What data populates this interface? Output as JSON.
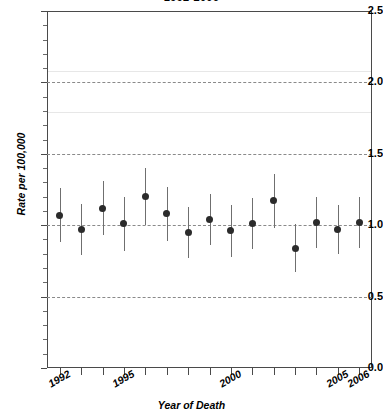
{
  "chart_data": {
    "type": "scatter",
    "title": "1992-2006",
    "xlabel": "Year of Death",
    "ylabel": "Rate per 100,000",
    "xlim": [
      1991.4,
      2006.6
    ],
    "ylim": [
      0.0,
      2.5
    ],
    "grid": true,
    "legend": "none",
    "y_ticks": [
      "0.0",
      "0.5",
      "1.0",
      "1.5",
      "2.0",
      "2.5"
    ],
    "y_tick_values": [
      0.0,
      0.5,
      1.0,
      1.5,
      2.0,
      2.5
    ],
    "y_minor_step": 0.1,
    "x_ticks": [
      1992,
      1993,
      1994,
      1995,
      1996,
      1997,
      1998,
      1999,
      2000,
      2001,
      2002,
      2003,
      2004,
      2005,
      2006
    ],
    "x_tick_labels": [
      {
        "year": 1992,
        "label": "1992"
      },
      {
        "year": 1995,
        "label": "1995"
      },
      {
        "year": 2000,
        "label": "2000"
      },
      {
        "year": 2005,
        "label": "2005"
      },
      {
        "year": 2006,
        "label": "2006"
      }
    ],
    "reference_line": {
      "y": 1.0,
      "style": "dashed"
    },
    "gridline_values": [
      0.5,
      1.0,
      1.5,
      2.0
    ],
    "marker_color": "#2b2b2b",
    "errorbar_color": "#6f6f6f",
    "x": [
      1992,
      1993,
      1994,
      1995,
      1996,
      1997,
      1998,
      1999,
      2000,
      2001,
      2002,
      2003,
      2004,
      2005,
      2006
    ],
    "values": [
      1.07,
      0.97,
      1.12,
      1.01,
      1.2,
      1.08,
      0.95,
      1.04,
      0.96,
      1.01,
      1.17,
      0.84,
      1.02,
      0.97,
      1.02
    ],
    "ci_low": [
      0.88,
      0.79,
      0.93,
      0.82,
      1.0,
      0.89,
      0.77,
      0.86,
      0.78,
      0.83,
      0.98,
      0.67,
      0.84,
      0.8,
      0.84
    ],
    "ci_high": [
      1.26,
      1.15,
      1.31,
      1.2,
      1.4,
      1.27,
      1.13,
      1.22,
      1.14,
      1.19,
      1.36,
      1.01,
      1.2,
      1.14,
      1.2
    ]
  },
  "axes": {
    "y_title": "Rate per 100,000",
    "x_title": "Year of Death"
  },
  "title": {
    "text": "1992-2006"
  }
}
